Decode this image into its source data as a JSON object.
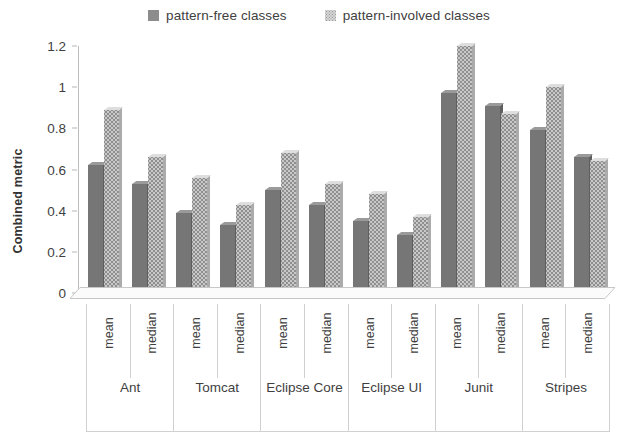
{
  "legend": {
    "position": "top-center",
    "entries": [
      {
        "label": "pattern-free classes",
        "swatch": "dark-gray-solid",
        "color": "#767676"
      },
      {
        "label": "pattern-involved classes",
        "swatch": "light-gray-dotted",
        "color": "#c9c9c9"
      }
    ]
  },
  "chart_data": {
    "type": "bar",
    "title": "",
    "xlabel": "",
    "ylabel": "Combined metric",
    "ylim": [
      0,
      1.2
    ],
    "ytick_labels": [
      "0",
      "0.2",
      "0.4",
      "0.6",
      "0.8",
      "1",
      "1.2"
    ],
    "ytick_values": [
      0,
      0.2,
      0.4,
      0.6,
      0.8,
      1,
      1.2
    ],
    "grid": false,
    "projects": [
      "Ant",
      "Tomcat",
      "Eclipse Core",
      "Eclipse UI",
      "Junit",
      "Stripes"
    ],
    "statistics": [
      "mean",
      "median"
    ],
    "categories": [
      "Ant mean",
      "Ant median",
      "Tomcat mean",
      "Tomcat median",
      "Eclipse Core mean",
      "Eclipse Core median",
      "Eclipse UI mean",
      "Eclipse UI median",
      "Junit mean",
      "Junit median",
      "Stripes mean",
      "Stripes median"
    ],
    "series": [
      {
        "name": "pattern-free classes",
        "color": "#767676",
        "values": [
          0.62,
          0.53,
          0.39,
          0.33,
          0.5,
          0.43,
          0.35,
          0.28,
          0.97,
          0.91,
          0.79,
          0.66
        ]
      },
      {
        "name": "pattern-involved classes",
        "color": "#c9c9c9",
        "values": [
          0.89,
          0.66,
          0.56,
          0.43,
          0.68,
          0.53,
          0.48,
          0.37,
          1.2,
          0.87,
          1.0,
          0.64
        ]
      }
    ]
  },
  "axis": {
    "y_title": "Combined metric"
  }
}
